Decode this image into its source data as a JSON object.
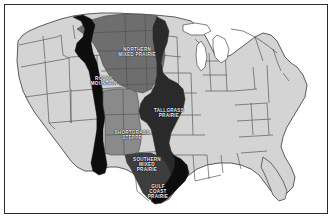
{
  "figure": {
    "name": "us-grassland-ecoregions-map",
    "type": "thematic-map",
    "frame_border_color": "#2b2b2b",
    "background_color": "#ffffff"
  },
  "palette": {
    "state_fill_light": "#d4d4d4",
    "state_outline": "#555555",
    "region_rocky_mountain": "#0d0d0d",
    "region_northern_mixed_prairie": "#6e6e6e",
    "region_tallgrass_prairie": "#2a2a2a",
    "region_shortgrass_steppe": "#8a8a8a",
    "region_southern_mixed_prairie": "#3d3d3d",
    "region_gulf_coast_prairie": "#0d0d0d",
    "label_text": "#f2f2f2"
  },
  "regions": [
    {
      "id": "rocky-mountain",
      "label": "ROCKY\nMOUNTAIN",
      "shade": "#0d0d0d",
      "label_x": 99,
      "label_y": 76
    },
    {
      "id": "northern-mixed-prairie",
      "label": "NORTHERN\nMIXED PRAIRIE",
      "shade": "#6e6e6e",
      "label_x": 132,
      "label_y": 47
    },
    {
      "id": "tallgrass-prairie",
      "label": "TALLGRASS\nPRAIRIE",
      "shade": "#2a2a2a",
      "label_x": 164,
      "label_y": 108
    },
    {
      "id": "shortgrass-steppe",
      "label": "SHORTGRASS\nSTEPPE",
      "shade": "#8a8a8a",
      "label_x": 127,
      "label_y": 130
    },
    {
      "id": "southern-mixed-prairie",
      "label": "SOUTHERN\nMIXED\nPRAIRIE",
      "shade": "#3d3d3d",
      "label_x": 142,
      "label_y": 160
    },
    {
      "id": "gulf-coast-prairie",
      "label": "GULF\nCOAST\nPRAIRIE",
      "shade": "#0d0d0d",
      "label_x": 153,
      "label_y": 187
    }
  ]
}
